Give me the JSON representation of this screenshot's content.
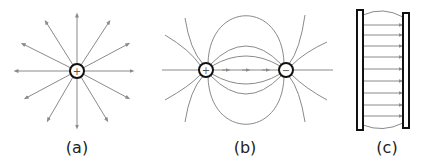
{
  "figures": [
    {
      "id": "a",
      "label": "(a)",
      "description": "Electric field lines radiating outward from a single positive point charge",
      "charge_symbol": "+",
      "center": [
        77,
        71
      ],
      "label_x": 77
    },
    {
      "id": "b",
      "label": "(b)",
      "description": "Electric field lines between a positive and a negative point charge (dipole)",
      "positive_symbol": "+",
      "negative_symbol": "−",
      "positive_center": [
        206,
        70
      ],
      "negative_center": [
        286,
        70
      ],
      "label_x": 245
    },
    {
      "id": "c",
      "label": "(c)",
      "description": "Uniform electric field between two parallel charged plates",
      "plate_symbol_left": "+",
      "plate_symbol_right": "−",
      "label_x": 387
    }
  ],
  "colors": {
    "field_line": "#8a8a8a",
    "charge_outline": "#111111",
    "plate_outline": "#111111",
    "text": "#222222"
  }
}
